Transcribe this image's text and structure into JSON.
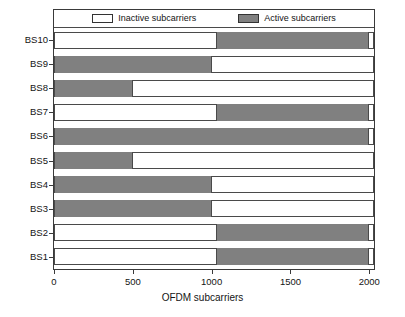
{
  "chart_data": {
    "type": "bar",
    "orientation": "horizontal",
    "stacked": true,
    "title": "",
    "xlabel": "OFDM subcarriers",
    "ylabel": "",
    "xlim": [
      0,
      2030
    ],
    "xticks": [
      0,
      500,
      1000,
      1500,
      2000
    ],
    "xtick_labels": [
      "0",
      "500",
      "1000",
      "1500",
      "2000"
    ],
    "categories": [
      "BS10",
      "BS9",
      "BS8",
      "BS7",
      "BS6",
      "BS5",
      "BS4",
      "BS3",
      "BS2",
      "BS1"
    ],
    "grid": false,
    "legend_position": "top-inside",
    "legend": [
      {
        "label": "Inactive subcarriers",
        "color": "#ffffff"
      },
      {
        "label": "Active subcarriers",
        "color": "#808080"
      }
    ],
    "colors": {
      "inactive": "#ffffff",
      "active": "#808080",
      "axis": "#3a3a3a"
    },
    "bars": [
      {
        "category": "BS10",
        "active_start": 1030,
        "active_end": 2000,
        "active_count": 970,
        "inactive_count": 1060
      },
      {
        "category": "BS9",
        "active_start": 0,
        "active_end": 1000,
        "active_count": 1000,
        "inactive_count": 1030
      },
      {
        "category": "BS8",
        "active_start": 0,
        "active_end": 500,
        "active_count": 500,
        "inactive_count": 1530
      },
      {
        "category": "BS7",
        "active_start": 1030,
        "active_end": 2000,
        "active_count": 970,
        "inactive_count": 1060
      },
      {
        "category": "BS6",
        "active_start": 0,
        "active_end": 2000,
        "active_count": 2000,
        "inactive_count": 30
      },
      {
        "category": "BS5",
        "active_start": 0,
        "active_end": 500,
        "active_count": 500,
        "inactive_count": 1530
      },
      {
        "category": "BS4",
        "active_start": 0,
        "active_end": 1000,
        "active_count": 1000,
        "inactive_count": 1030
      },
      {
        "category": "BS3",
        "active_start": 0,
        "active_end": 1000,
        "active_count": 1000,
        "inactive_count": 1030
      },
      {
        "category": "BS2",
        "active_start": 1030,
        "active_end": 2000,
        "active_count": 970,
        "inactive_count": 1060
      },
      {
        "category": "BS1",
        "active_start": 1030,
        "active_end": 2000,
        "active_count": 970,
        "inactive_count": 1060
      }
    ]
  }
}
